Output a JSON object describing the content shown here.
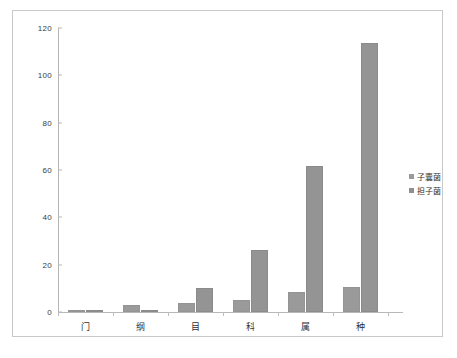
{
  "chart_data": {
    "type": "bar",
    "title": "",
    "subtitle": "",
    "xlabel": "",
    "ylabel": "",
    "categories": [
      "门",
      "纲",
      "目",
      "科",
      "属",
      "种"
    ],
    "series": [
      {
        "name": "子囊菌",
        "values": [
          1,
          3,
          4,
          5,
          8.5,
          10.5
        ],
        "color": "#9a9a9a"
      },
      {
        "name": "担子菌",
        "values": [
          1,
          1,
          10,
          26,
          61.5,
          113.5
        ],
        "color": "#949494"
      }
    ],
    "ylim": [
      0,
      120
    ],
    "yticks": [
      0,
      20,
      40,
      60,
      80,
      100,
      120
    ],
    "ytick_labels": [
      "0",
      "20",
      "40",
      "60",
      "80",
      "100",
      "120"
    ],
    "grid": false,
    "legend_position": "right",
    "legend_entries": [
      "子囊菌",
      "担子菌"
    ],
    "plot_background": "#ffffff",
    "axis_color": "#b5b5b5",
    "frame_color": "#c9c9c9"
  }
}
